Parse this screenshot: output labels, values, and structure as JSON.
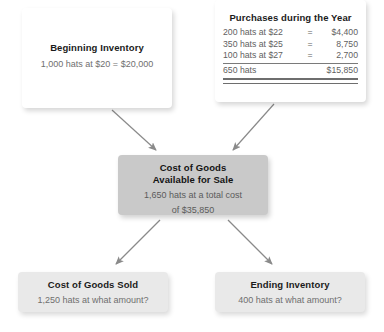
{
  "diagram": {
    "colors": {
      "box_white": "#ffffff",
      "box_gray": "#c9c9c9",
      "box_light_gray": "#e9e9e9",
      "arrow": "#8a8a8a",
      "heading_text": "#1b1b1b",
      "body_text": "#6f6f6f"
    }
  },
  "nodes": {
    "beginning_inventory": {
      "title": "Beginning Inventory",
      "body": "1,000 hats at $20 = $20,000"
    },
    "purchases": {
      "title": "Purchases during the Year",
      "rows": [
        {
          "desc": "200 hats at $22",
          "eq": "=",
          "amt": "$4,400"
        },
        {
          "desc": "350 hats at $25",
          "eq": "=",
          "amt": "8,750"
        },
        {
          "desc": "100 hats at $27",
          "eq": "=",
          "amt": "2,700"
        }
      ],
      "total": {
        "desc": "650 hats",
        "eq": "",
        "amt": "$15,850"
      }
    },
    "cost_of_goods_available": {
      "title_line1": "Cost of Goods",
      "title_line2": "Available for Sale",
      "body_line1": "1,650 hats at a total cost",
      "body_line2": "of $35,850"
    },
    "cost_of_goods_sold": {
      "title": "Cost of Goods Sold",
      "body": "1,250 hats at what amount?"
    },
    "ending_inventory": {
      "title": "Ending Inventory",
      "body": "400 hats at what amount?"
    }
  },
  "arrows": [
    {
      "name": "beginning-to-available",
      "from": "beginning_inventory",
      "to": "cost_of_goods_available"
    },
    {
      "name": "purchases-to-available",
      "from": "purchases",
      "to": "cost_of_goods_available"
    },
    {
      "name": "available-to-cogs",
      "from": "cost_of_goods_available",
      "to": "cost_of_goods_sold"
    },
    {
      "name": "available-to-ending",
      "from": "cost_of_goods_available",
      "to": "ending_inventory"
    }
  ]
}
